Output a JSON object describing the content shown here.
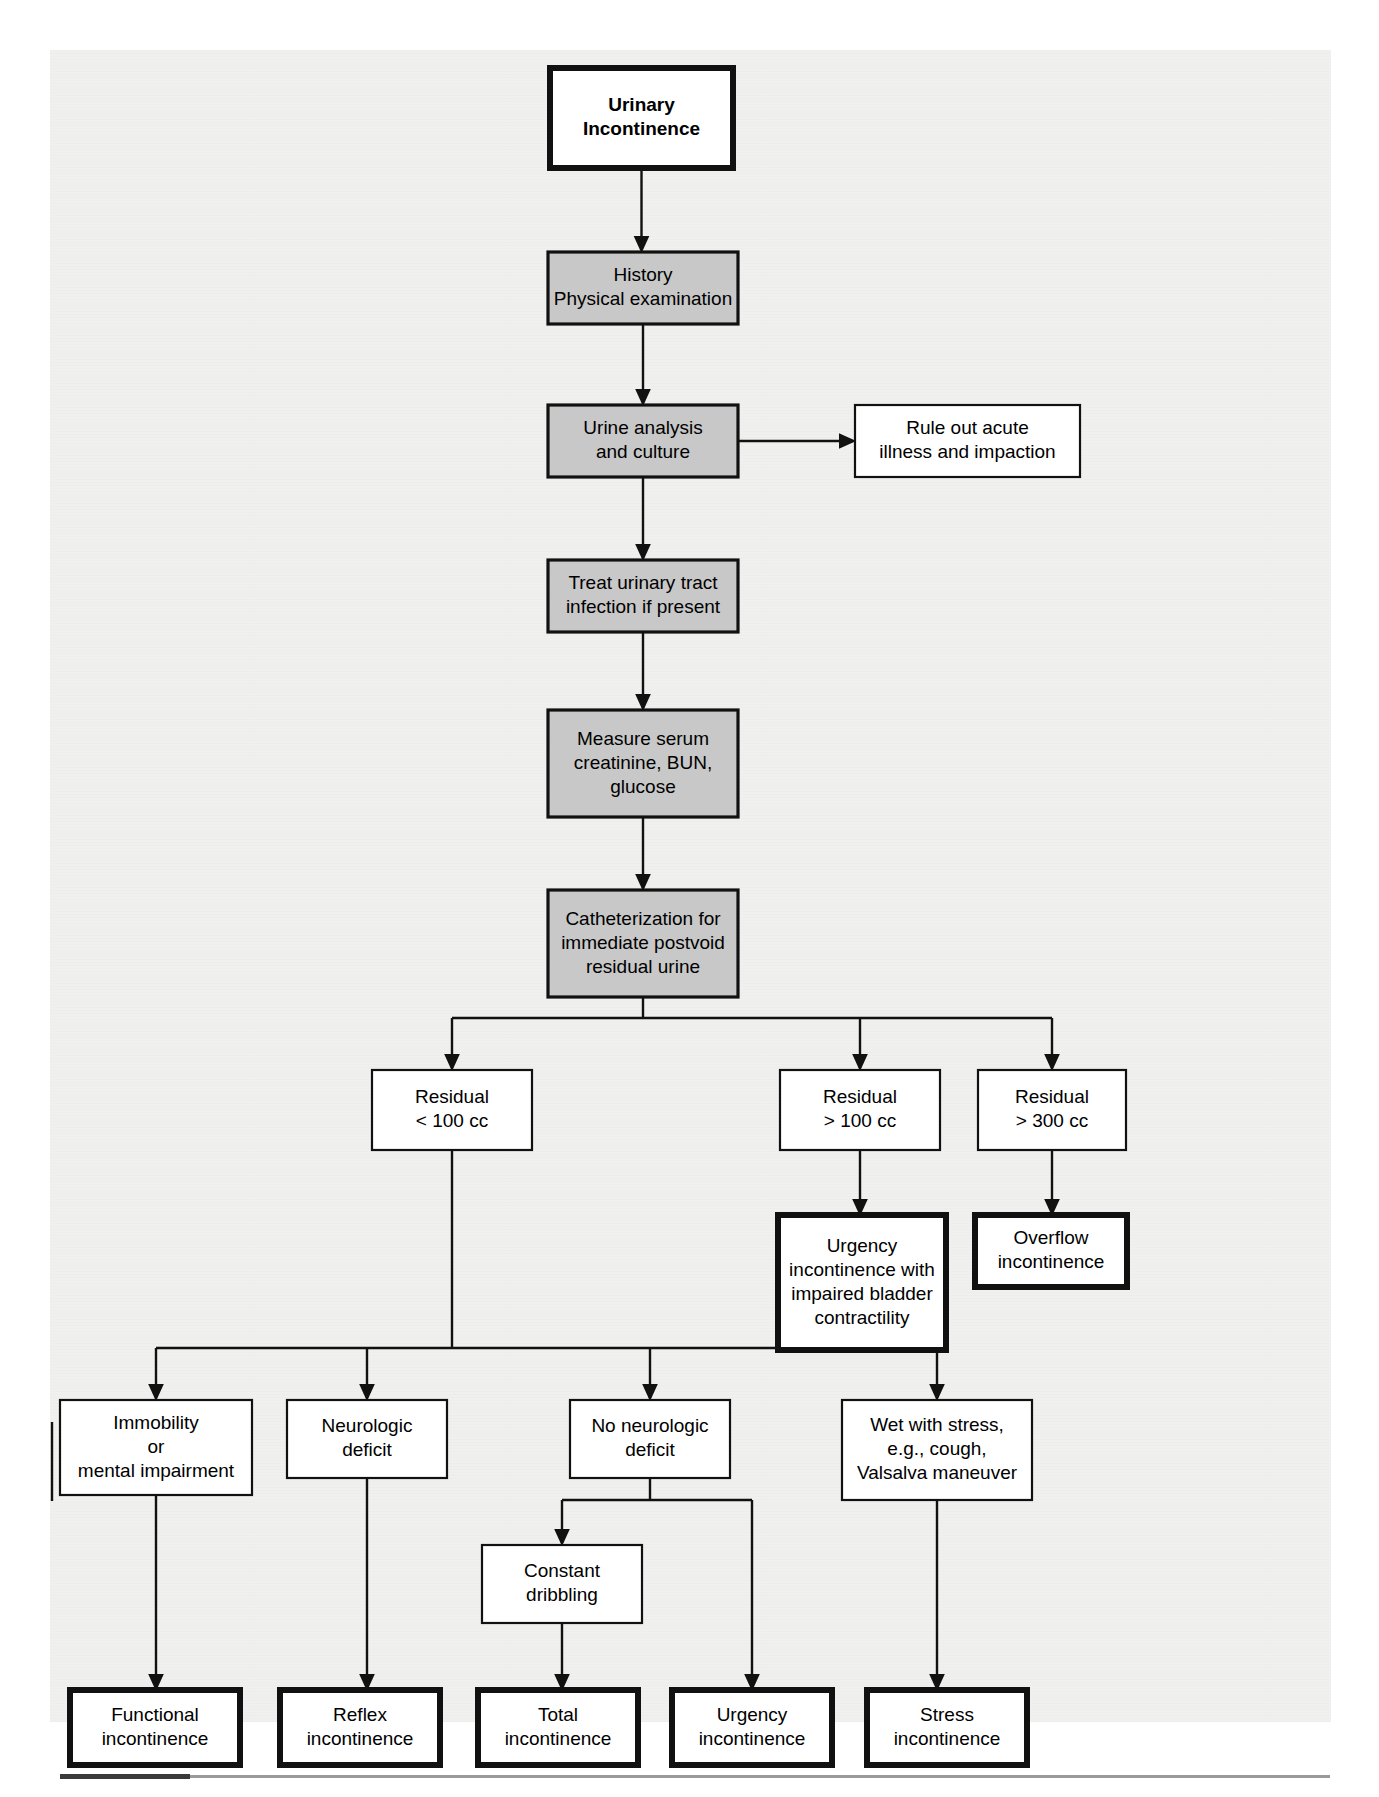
{
  "diagram": {
    "colors": {
      "shaded_box_fill": "#c8c8c8",
      "plain_box_fill": "#ffffff",
      "line": "#111111",
      "page_background": "#f0f0ee"
    },
    "nodes": [
      {
        "id": "urinary-incontinence",
        "style": "thick-white",
        "lines": [
          "Urinary",
          "Incontinence"
        ],
        "bold": true
      },
      {
        "id": "history-physical-examination",
        "style": "shaded",
        "lines": [
          "History",
          "Physical examination"
        ],
        "bold": false
      },
      {
        "id": "urine-analysis-and-culture",
        "style": "shaded",
        "lines": [
          "Urine analysis",
          "and culture"
        ],
        "bold": false
      },
      {
        "id": "rule-out-acute-illness-and-impaction",
        "style": "thin-white",
        "lines": [
          "Rule out acute",
          "illness and impaction"
        ],
        "bold": false
      },
      {
        "id": "treat-urinary-tract-infection",
        "style": "shaded",
        "lines": [
          "Treat urinary tract",
          "infection if present"
        ],
        "bold": false
      },
      {
        "id": "measure-serum-creatinine-bun-glucose",
        "style": "shaded",
        "lines": [
          "Measure serum",
          "creatinine, BUN,",
          "glucose"
        ],
        "bold": false
      },
      {
        "id": "catheterization-postvoid-residual",
        "style": "shaded",
        "lines": [
          "Catheterization for",
          "immediate postvoid",
          "residual urine"
        ],
        "bold": false
      },
      {
        "id": "residual-less-than-100-cc",
        "style": "thin-white",
        "lines": [
          "Residual",
          "< 100 cc"
        ],
        "bold": false
      },
      {
        "id": "residual-greater-than-100-cc",
        "style": "thin-white",
        "lines": [
          "Residual",
          "> 100 cc"
        ],
        "bold": false
      },
      {
        "id": "residual-greater-than-300-cc",
        "style": "thin-white",
        "lines": [
          "Residual",
          "> 300 cc"
        ],
        "bold": false
      },
      {
        "id": "urgency-incontinence-impaired-bladder-contractility",
        "style": "thick-white",
        "lines": [
          "Urgency",
          "incontinence with",
          "impaired bladder",
          "contractility"
        ],
        "bold": false
      },
      {
        "id": "overflow-incontinence",
        "style": "thick-white",
        "lines": [
          "Overflow",
          "incontinence"
        ],
        "bold": false
      },
      {
        "id": "immobility-or-mental-impairment",
        "style": "thin-white",
        "lines": [
          "Immobility",
          "or",
          "mental impairment"
        ],
        "bold": false
      },
      {
        "id": "neurologic-deficit",
        "style": "thin-white",
        "lines": [
          "Neurologic",
          "deficit"
        ],
        "bold": false
      },
      {
        "id": "no-neurologic-deficit",
        "style": "thin-white",
        "lines": [
          "No neurologic",
          "deficit"
        ],
        "bold": false
      },
      {
        "id": "wet-with-stress",
        "style": "thin-white",
        "lines": [
          "Wet with stress,",
          "e.g., cough,",
          "Valsalva maneuver"
        ],
        "bold": false
      },
      {
        "id": "constant-dribbling",
        "style": "thin-white",
        "lines": [
          "Constant",
          "dribbling"
        ],
        "bold": false
      },
      {
        "id": "functional-incontinence",
        "style": "thick-white",
        "lines": [
          "Functional",
          "incontinence"
        ],
        "bold": false
      },
      {
        "id": "reflex-incontinence",
        "style": "thick-white",
        "lines": [
          "Reflex",
          "incontinence"
        ],
        "bold": false
      },
      {
        "id": "total-incontinence",
        "style": "thick-white",
        "lines": [
          "Total",
          "incontinence"
        ],
        "bold": false
      },
      {
        "id": "urgency-incontinence",
        "style": "thick-white",
        "lines": [
          "Urgency",
          "incontinence"
        ],
        "bold": false
      },
      {
        "id": "stress-incontinence",
        "style": "thick-white",
        "lines": [
          "Stress",
          "incontinence"
        ],
        "bold": false
      }
    ],
    "edges": [
      {
        "from": "urinary-incontinence",
        "to": "history-physical-examination"
      },
      {
        "from": "history-physical-examination",
        "to": "urine-analysis-and-culture"
      },
      {
        "from": "urine-analysis-and-culture",
        "to": "rule-out-acute-illness-and-impaction"
      },
      {
        "from": "urine-analysis-and-culture",
        "to": "treat-urinary-tract-infection"
      },
      {
        "from": "treat-urinary-tract-infection",
        "to": "measure-serum-creatinine-bun-glucose"
      },
      {
        "from": "measure-serum-creatinine-bun-glucose",
        "to": "catheterization-postvoid-residual"
      },
      {
        "from": "catheterization-postvoid-residual",
        "to": "residual-less-than-100-cc"
      },
      {
        "from": "catheterization-postvoid-residual",
        "to": "residual-greater-than-100-cc"
      },
      {
        "from": "catheterization-postvoid-residual",
        "to": "residual-greater-than-300-cc"
      },
      {
        "from": "residual-greater-than-100-cc",
        "to": "urgency-incontinence-impaired-bladder-contractility"
      },
      {
        "from": "residual-greater-than-300-cc",
        "to": "overflow-incontinence"
      },
      {
        "from": "residual-less-than-100-cc",
        "to": "immobility-or-mental-impairment"
      },
      {
        "from": "residual-less-than-100-cc",
        "to": "neurologic-deficit"
      },
      {
        "from": "residual-less-than-100-cc",
        "to": "no-neurologic-deficit"
      },
      {
        "from": "residual-less-than-100-cc",
        "to": "wet-with-stress"
      },
      {
        "from": "immobility-or-mental-impairment",
        "to": "functional-incontinence"
      },
      {
        "from": "neurologic-deficit",
        "to": "reflex-incontinence"
      },
      {
        "from": "no-neurologic-deficit",
        "to": "constant-dribbling"
      },
      {
        "from": "no-neurologic-deficit",
        "to": "urgency-incontinence"
      },
      {
        "from": "constant-dribbling",
        "to": "total-incontinence"
      },
      {
        "from": "wet-with-stress",
        "to": "stress-incontinence"
      }
    ]
  }
}
